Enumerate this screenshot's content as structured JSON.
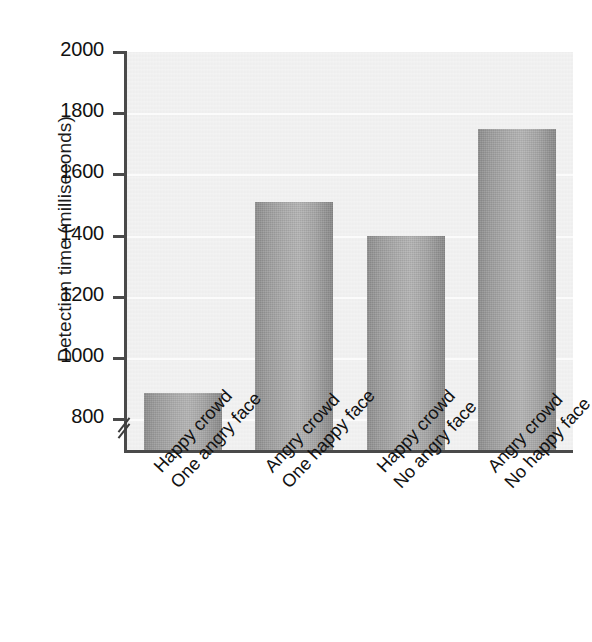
{
  "chart_data": {
    "type": "bar",
    "title": "",
    "xlabel": "",
    "ylabel": "Detection time (milliseconds)",
    "ylim": [
      700,
      2000
    ],
    "yticks": [
      800,
      1000,
      1200,
      1400,
      1600,
      1800,
      2000
    ],
    "ytick_labels": [
      "800",
      "1000",
      "1200",
      "1400",
      "1600",
      "1800",
      "2000"
    ],
    "axis_break": true,
    "axis_break_symbol": "//",
    "grid": true,
    "grid_axis": "y",
    "legend": "none",
    "categories": [
      "Happy crowd\nOne angry face",
      "Angry crowd\nOne happy face",
      "Happy crowd\nNo angry face",
      "Angry crowd\nNo happy face"
    ],
    "category_lines": [
      [
        "Happy crowd",
        "One angry face"
      ],
      [
        "Angry crowd",
        "One happy face"
      ],
      [
        "Happy crowd",
        "No angry face"
      ],
      [
        "Angry crowd",
        "No happy face"
      ]
    ],
    "values": [
      885,
      1510,
      1400,
      1750
    ],
    "bar_color": "#a8a8a8",
    "plot_background": "#efefef"
  },
  "axis": {
    "y_title": "Detection time (milliseconds)"
  },
  "colors": {
    "bar_light": "#b4b4b4",
    "bar_dark": "#8d8d8d",
    "axis": "#4a4a4a",
    "plot_bg": "#efefef",
    "gridline": "#fbfbfb",
    "text": "#111111"
  }
}
